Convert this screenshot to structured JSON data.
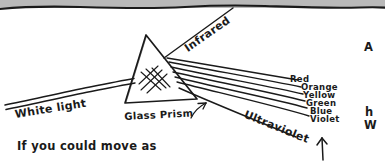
{
  "page": {
    "width": 385,
    "height": 161,
    "background_color": "#ffffff",
    "scan_edge_color": "#b9b9b9",
    "ink_color": "#1a1a1a"
  },
  "diagram": {
    "type": "hand-drawn-physics-illustration",
    "incoming_beam_label": "White light",
    "prism_label": "Glass Prism",
    "infrared_label": "Infrared",
    "ultraviolet_label": "Ultraviolet",
    "spectrum_labels": [
      "Red",
      "Orange",
      "Yellow",
      "Green",
      "Blue",
      "Violet"
    ]
  },
  "caption": {
    "bottom_left_text": "If you could move as"
  },
  "margin_fragments": {
    "top_right": "A",
    "lower_right_1": "h",
    "lower_right_2": "W"
  },
  "annotations": {
    "prism_pointer": "arrow pointing to prism",
    "bottom_arrow": "upward arrow"
  }
}
